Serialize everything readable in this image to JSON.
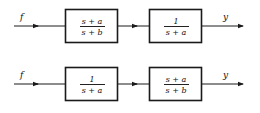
{
  "diagrams": [
    {
      "input_label": "f",
      "output_label": "y",
      "blocks": [
        {
          "numerator": "s + a",
          "denominator": "s + b"
        },
        {
          "numerator": "1",
          "denominator": "s + a"
        }
      ]
    },
    {
      "input_label": "f",
      "output_label": "y",
      "blocks": [
        {
          "numerator": "1",
          "denominator": "s + a"
        },
        {
          "numerator": "s + a",
          "denominator": "s + b"
        }
      ]
    }
  ],
  "colors": {
    "stroke": "#1a1a1a",
    "background": "#ffffff"
  }
}
